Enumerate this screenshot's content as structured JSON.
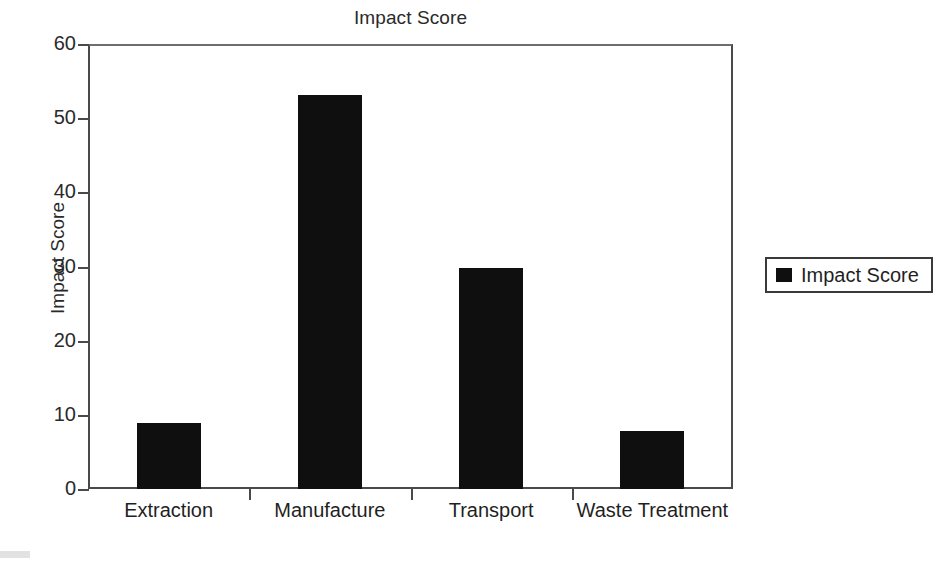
{
  "chart_data": {
    "type": "bar",
    "title": "Impact Score",
    "xlabel": "",
    "ylabel": "Impact Score",
    "categories": [
      "Extraction",
      "Manufacture",
      "Transport",
      "Waste Treatment"
    ],
    "values": [
      8.9,
      53.1,
      29.8,
      7.8
    ],
    "series": [
      {
        "name": "Impact Score",
        "values": [
          8.9,
          53.1,
          29.8,
          7.8
        ]
      }
    ],
    "ylim": [
      0,
      60
    ],
    "yticks": [
      0,
      10,
      20,
      30,
      40,
      50,
      60
    ],
    "ytick_labels": [
      "0",
      "10",
      "20",
      "30",
      "40",
      "50",
      "60"
    ],
    "grid": false,
    "legend": {
      "position": "right",
      "entries": [
        {
          "label": "Impact Score",
          "color": "#100f0f"
        }
      ]
    },
    "bar_color": "#100f0f",
    "axis_color": "#4a4a4a",
    "background": "#ffffff"
  }
}
